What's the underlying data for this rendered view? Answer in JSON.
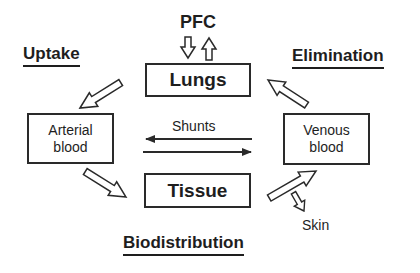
{
  "diagram": {
    "input": {
      "label": "PFC"
    },
    "headings": {
      "uptake": "Uptake",
      "elimination": "Elimination",
      "biodistribution": "Biodistribution"
    },
    "nodes": {
      "lungs": "Lungs",
      "arterial_blood": {
        "line1": "Arterial",
        "line2": "blood"
      },
      "venous_blood": {
        "line1": "Venous",
        "line2": "blood"
      },
      "tissue": "Tissue"
    },
    "edges": {
      "shunts": "Shunts",
      "skin": "Skin"
    },
    "flows": [
      {
        "from": "PFC",
        "to": "Lungs",
        "style": "hollow-arrow-down"
      },
      {
        "from": "Lungs",
        "to": "PFC",
        "style": "hollow-arrow-up"
      },
      {
        "from": "Lungs",
        "to": "Arterial blood",
        "style": "hollow-arrow"
      },
      {
        "from": "Arterial blood",
        "to": "Tissue",
        "style": "hollow-arrow"
      },
      {
        "from": "Tissue",
        "to": "Venous blood",
        "style": "hollow-arrow"
      },
      {
        "from": "Venous blood",
        "to": "Lungs",
        "style": "hollow-arrow"
      },
      {
        "from": "Venous blood",
        "to": "Arterial blood",
        "style": "line-arrow",
        "label": "Shunts"
      },
      {
        "from": "Arterial blood",
        "to": "Venous blood",
        "style": "line-arrow",
        "label": "Shunts"
      },
      {
        "from": "Tissue-Venous path",
        "to": "Skin",
        "style": "hollow-arrow-small"
      }
    ]
  }
}
